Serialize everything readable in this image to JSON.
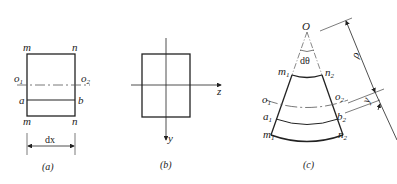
{
  "figure_a": {
    "caption": "(a)",
    "labels": {
      "top_left": "m",
      "top_right": "n",
      "bottom_left": "m",
      "bottom_right": "n",
      "neutral_left": "o",
      "neutral_left_sub": "1",
      "neutral_right": "o",
      "neutral_right_sub": "2",
      "fiber_left": "a",
      "fiber_right": "b",
      "width": "dx"
    }
  },
  "figure_b": {
    "caption": "(b)",
    "labels": {
      "z_axis": "z",
      "y_axis": "y"
    }
  },
  "figure_c": {
    "caption": "(c)",
    "labels": {
      "center": "O",
      "angle": "dθ",
      "top_left": "m",
      "top_left_sub": "1",
      "top_right": "n",
      "top_right_sub": "2",
      "neutral_left": "o",
      "neutral_left_sub": "1",
      "neutral_right": "o",
      "neutral_right_sub": "2",
      "fiber_left": "a",
      "fiber_left_sub": "1",
      "fiber_right": "b",
      "fiber_right_sub": "2",
      "bottom_left": "m",
      "bottom_left_sub": "1",
      "bottom_right": "n",
      "bottom_right_sub": "2",
      "radius": "ρ",
      "distance": "y"
    }
  },
  "colors": {
    "line": "#222222",
    "background": "#ffffff"
  }
}
